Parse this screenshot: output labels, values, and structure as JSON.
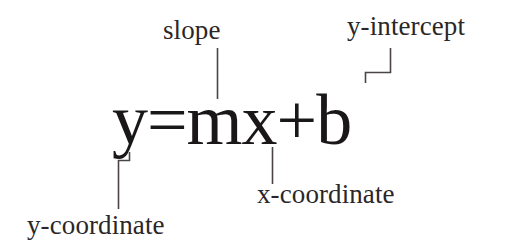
{
  "figure": {
    "type": "annotated-equation-diagram",
    "background_color": "#ffffff",
    "ink_color": "#231f20",
    "leader_line_color": "#4a4446",
    "equation": "y=mx+b"
  },
  "equation": {
    "text": "y=mx+b",
    "terms": [
      {
        "symbol": "y",
        "meaning": "y-coordinate"
      },
      {
        "symbol": "m",
        "meaning": "slope"
      },
      {
        "symbol": "x",
        "meaning": "x-coordinate"
      },
      {
        "symbol": "b",
        "meaning": "y-intercept"
      }
    ]
  },
  "annotations": {
    "slope": {
      "label": "slope",
      "position": "above",
      "connector": "straight-vertical-line",
      "points_to": "m"
    },
    "y_intercept": {
      "label": "y-intercept",
      "position": "above-right",
      "connector": "elbow-bracket",
      "points_to": "b"
    },
    "x_coordinate": {
      "label": "x-coordinate",
      "position": "below",
      "connector": "straight-vertical-line",
      "points_to": "x"
    },
    "y_coordinate": {
      "label": "y-coordinate",
      "position": "below-left",
      "connector": "elbow-bracket",
      "points_to": "y"
    }
  }
}
